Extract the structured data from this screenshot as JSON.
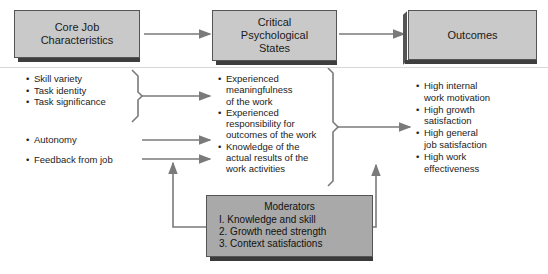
{
  "diagram": {
    "type": "flow",
    "boxes": {
      "core": {
        "label_line1": "Core Job",
        "label_line2": "Characteristics"
      },
      "critical": {
        "label_line1": "Critical",
        "label_line2": "Psychological",
        "label_line3": "States"
      },
      "outcomes": {
        "label": "Outcomes"
      }
    },
    "core_characteristics": {
      "group1": [
        "Skill variety",
        "Task identity",
        "Task significance"
      ],
      "autonomy": "Autonomy",
      "feedback": "Feedback from job"
    },
    "psychological_states": [
      {
        "line1": "Experienced",
        "line2": "meaningfulness",
        "line3": "of the work"
      },
      {
        "line1": "Experienced",
        "line2": "responsibility for",
        "line3": "outcomes of the work"
      },
      {
        "line1": "Knowledge of the",
        "line2": "actual results of the",
        "line3": "work activities"
      }
    ],
    "outcomes": [
      {
        "line1": "High internal",
        "line2": "work motivation"
      },
      {
        "line1": "High growth",
        "line2": "satisfaction"
      },
      {
        "line1": "High general",
        "line2": "job satisfaction"
      },
      {
        "line1": "High work",
        "line2": "effectiveness"
      }
    ],
    "moderators": {
      "title": "Moderators",
      "items": [
        "I. Knowledge and skill",
        "2. Growth need strength",
        "3. Context satisfactions"
      ]
    },
    "colors": {
      "box_fill": "#c9c9c9",
      "moderator_fill": "#a9a9a9",
      "arrow": "#7a7a7a",
      "shadow": "#3e3e3e"
    }
  }
}
